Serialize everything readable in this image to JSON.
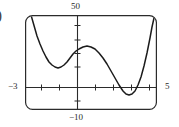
{
  "figure": {
    "part_marker": ")",
    "frame": {
      "x": 25,
      "y": 15,
      "width": 132,
      "height": 95,
      "corner_radius": 7
    }
  },
  "labels": {
    "top": "50",
    "bottom": "−10",
    "left": "−3",
    "right": "5"
  },
  "chart_data": {
    "type": "line",
    "title": "",
    "xlabel": "",
    "ylabel": "",
    "xlim": [
      -3,
      5
    ],
    "ylim": [
      -10,
      50
    ],
    "grid": false,
    "legend": null,
    "axis_labels": {
      "xmin": "−3",
      "xmax": "5",
      "ymax": "50",
      "ymin": "−10"
    },
    "x_ticks": [
      -2,
      -1,
      0,
      1,
      2,
      3,
      4
    ],
    "y_ticks": [
      -10,
      0,
      10,
      20,
      30,
      40,
      50
    ],
    "features": [
      {
        "kind": "local-minimum",
        "x": -1.0,
        "y": 16.0
      },
      {
        "kind": "local-maximum",
        "x": 0.65,
        "y": 29.5
      },
      {
        "kind": "local-minimum",
        "x": 3.1,
        "y": -3.5
      }
    ],
    "series": [
      {
        "name": "curve",
        "color": "#1b1b1b",
        "points_px": [
          [
            31,
            15
          ],
          [
            33,
            22
          ],
          [
            35,
            29
          ],
          [
            37,
            36
          ],
          [
            40,
            44
          ],
          [
            43,
            51
          ],
          [
            46,
            57
          ],
          [
            49,
            62
          ],
          [
            52,
            65
          ],
          [
            55,
            67
          ],
          [
            58,
            68
          ],
          [
            61,
            67
          ],
          [
            64,
            65
          ],
          [
            67,
            62
          ],
          [
            70,
            58
          ],
          [
            73,
            54
          ],
          [
            76,
            51
          ],
          [
            79,
            49
          ],
          [
            83,
            47
          ],
          [
            87,
            46
          ],
          [
            91,
            47
          ],
          [
            95,
            49
          ],
          [
            99,
            53
          ],
          [
            103,
            58
          ],
          [
            107,
            64
          ],
          [
            111,
            71
          ],
          [
            115,
            78
          ],
          [
            119,
            85
          ],
          [
            123,
            91
          ],
          [
            126,
            94
          ],
          [
            129,
            95
          ],
          [
            132,
            94
          ],
          [
            135,
            91
          ],
          [
            138,
            85
          ],
          [
            141,
            77
          ],
          [
            144,
            66
          ],
          [
            147,
            53
          ],
          [
            150,
            38
          ],
          [
            152,
            27
          ],
          [
            154,
            18
          ],
          [
            155,
            15
          ]
        ]
      }
    ]
  }
}
